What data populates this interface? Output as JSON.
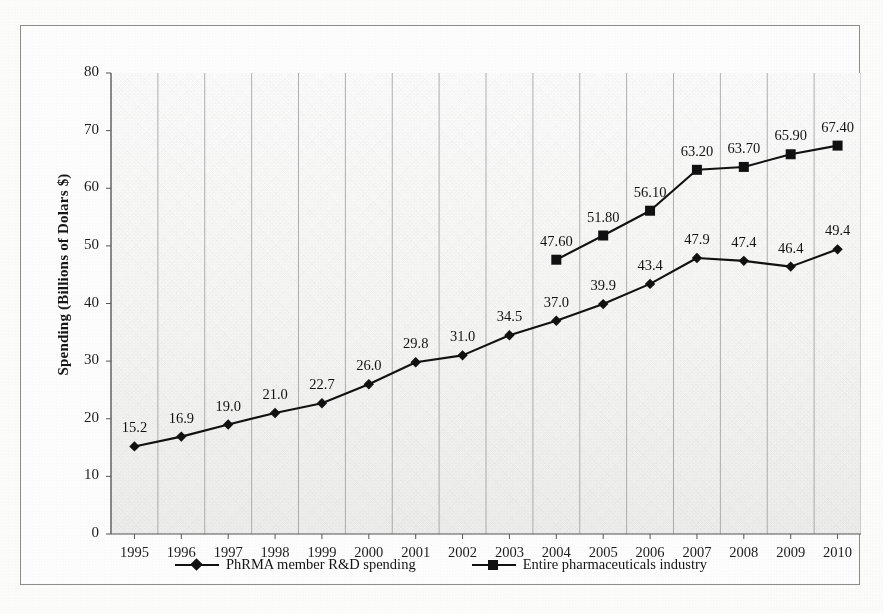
{
  "chart_data": {
    "type": "line",
    "title": "",
    "xlabel": "",
    "ylabel": "Spending (Billions of Dolars $)",
    "categories": [
      "1995",
      "1996",
      "1997",
      "1998",
      "1999",
      "2000",
      "2001",
      "2002",
      "2003",
      "2004",
      "2005",
      "2006",
      "2007",
      "2008",
      "2009",
      "2010"
    ],
    "ylim": [
      0,
      80
    ],
    "yticks": [
      "0",
      "10",
      "20",
      "30",
      "40",
      "50",
      "60",
      "70",
      "80"
    ],
    "grid": "vertical",
    "legend_position": "bottom",
    "series": [
      {
        "name": "PhRMA member R&D spending",
        "marker": "diamond",
        "color": "#111111",
        "values": [
          15.2,
          16.9,
          19.0,
          21.0,
          22.7,
          26.0,
          29.8,
          31.0,
          34.5,
          37.0,
          39.9,
          43.4,
          47.9,
          47.4,
          46.4,
          49.4
        ],
        "labels": [
          "15.2",
          "16.9",
          "19.0",
          "21.0",
          "22.7",
          "26.0",
          "29.8",
          "31.0",
          "34.5",
          "37.0",
          "39.9",
          "43.4",
          "47.9",
          "47.4",
          "46.4",
          "49.4"
        ]
      },
      {
        "name": "Entire pharmaceuticals industry",
        "marker": "square",
        "color": "#111111",
        "values": [
          null,
          null,
          null,
          null,
          null,
          null,
          null,
          null,
          null,
          47.6,
          51.8,
          56.1,
          63.2,
          63.7,
          65.9,
          67.4
        ],
        "labels": [
          "",
          "",
          "",
          "",
          "",
          "",
          "",
          "",
          "",
          "47.60",
          "51.80",
          "56.10",
          "63.20",
          "63.70",
          "65.90",
          "67.40"
        ]
      }
    ]
  },
  "legend": {
    "items": [
      {
        "label": "PhRMA member R&D spending",
        "marker": "diamond-marker"
      },
      {
        "label": "Entire pharmaceuticals industry",
        "marker": "square-marker"
      }
    ]
  }
}
